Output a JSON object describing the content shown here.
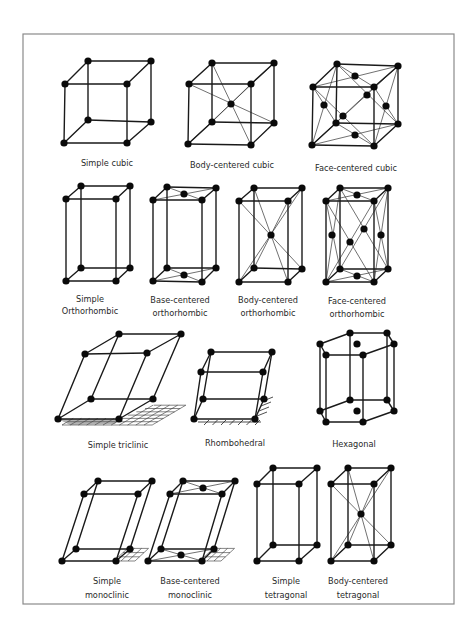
{
  "figure": {
    "frame": {
      "x": 23,
      "y": 34,
      "width": 431,
      "height": 570,
      "color": "#8a8a8a"
    },
    "atom_color": "#0a0a0a",
    "edge_color": "#1a1a1a"
  },
  "lattices": [
    {
      "id": "simple-cubic",
      "label_lines": [
        "Simple cubic"
      ],
      "label_x": 107,
      "label_y": [
        166
      ]
    },
    {
      "id": "body-centered-cubic",
      "label_lines": [
        "Body-centered cubic"
      ],
      "label_x": 232,
      "label_y": [
        168
      ]
    },
    {
      "id": "face-centered-cubic",
      "label_lines": [
        "Face-centered cubic"
      ],
      "label_x": 356,
      "label_y": [
        171
      ]
    },
    {
      "id": "simple-orthorhombic",
      "label_lines": [
        "Simple",
        "Orthorhombic"
      ],
      "label_x": 90,
      "label_y": [
        302,
        314
      ]
    },
    {
      "id": "base-centered-orthorhombic",
      "label_lines": [
        "Base-centered",
        "orthorhombic"
      ],
      "label_x": 180,
      "label_y": [
        303,
        316
      ]
    },
    {
      "id": "body-centered-orthorhombic",
      "label_lines": [
        "Body-centered",
        "orthorhombic"
      ],
      "label_x": 268,
      "label_y": [
        303,
        316
      ]
    },
    {
      "id": "face-centered-orthorhombic",
      "label_lines": [
        "Face-centered",
        "orthorhombic"
      ],
      "label_x": 357,
      "label_y": [
        304,
        317
      ]
    },
    {
      "id": "simple-triclinic",
      "label_lines": [
        "Simple triclinic"
      ],
      "label_x": 118,
      "label_y": [
        448
      ]
    },
    {
      "id": "rhombohedral",
      "label_lines": [
        "Rhombohedral"
      ],
      "label_x": 235,
      "label_y": [
        446
      ]
    },
    {
      "id": "hexagonal",
      "label_lines": [
        "Hexagonal"
      ],
      "label_x": 354,
      "label_y": [
        447
      ]
    },
    {
      "id": "simple-monoclinic",
      "label_lines": [
        "Simple",
        "monoclinic"
      ],
      "label_x": 107,
      "label_y": [
        584,
        598
      ]
    },
    {
      "id": "base-centered-monoclinic",
      "label_lines": [
        "Base-centered",
        "monoclinic"
      ],
      "label_x": 190,
      "label_y": [
        584,
        598
      ]
    },
    {
      "id": "simple-tetragonal",
      "label_lines": [
        "Simple",
        "tetragonal"
      ],
      "label_x": 286,
      "label_y": [
        584,
        598
      ]
    },
    {
      "id": "body-centered-tetragonal",
      "label_lines": [
        "Body-centered",
        "tetragonal"
      ],
      "label_x": 358,
      "label_y": [
        584,
        598
      ]
    }
  ],
  "geometry": {
    "simple-cubic": {
      "box": [
        [
          88,
          61
        ],
        [
          151,
          61
        ],
        [
          127,
          84
        ],
        [
          65,
          84
        ],
        [
          88,
          120
        ],
        [
          151,
          122
        ],
        [
          127,
          143
        ],
        [
          64,
          143
        ]
      ],
      "extra": [],
      "diagonals": []
    },
    "body-centered-cubic": {
      "box": [
        [
          212,
          63
        ],
        [
          274,
          63
        ],
        [
          251,
          84
        ],
        [
          189,
          84
        ],
        [
          212,
          122
        ],
        [
          274,
          123
        ],
        [
          251,
          145
        ],
        [
          188,
          144
        ]
      ],
      "extra": [
        [
          231,
          104
        ]
      ],
      "diagonals": [
        [
          0,
          6
        ],
        [
          1,
          7
        ],
        [
          2,
          4
        ],
        [
          3,
          5
        ]
      ]
    },
    "face-centered-cubic": {
      "box": [
        [
          337,
          64
        ],
        [
          398,
          66
        ],
        [
          374,
          87
        ],
        [
          313,
          87
        ],
        [
          336,
          123
        ],
        [
          398,
          124
        ],
        [
          374,
          146
        ],
        [
          312,
          145
        ]
      ],
      "extra": [
        [
          355,
          76
        ],
        [
          367,
          95
        ],
        [
          324,
          105
        ],
        [
          386,
          106
        ],
        [
          343,
          116
        ],
        [
          355,
          135
        ]
      ],
      "faces": [
        [
          0,
          1,
          2,
          3
        ],
        [
          0,
          1,
          5,
          4
        ],
        [
          0,
          3,
          7,
          4
        ],
        [
          1,
          2,
          6,
          5
        ],
        [
          3,
          2,
          6,
          7
        ],
        [
          4,
          5,
          6,
          7
        ]
      ]
    },
    "simple-orthorhombic": {
      "box": [
        [
          81,
          186
        ],
        [
          130,
          186
        ],
        [
          116,
          199
        ],
        [
          66,
          199
        ],
        [
          81,
          268
        ],
        [
          130,
          268
        ],
        [
          116,
          281
        ],
        [
          66,
          281
        ]
      ],
      "extra": []
    },
    "base-centered-orthorhombic": {
      "box": [
        [
          167,
          187
        ],
        [
          216,
          188
        ],
        [
          202,
          200
        ],
        [
          153,
          200
        ],
        [
          167,
          268
        ],
        [
          216,
          268
        ],
        [
          202,
          282
        ],
        [
          153,
          281
        ]
      ],
      "extra": [
        [
          184,
          194
        ],
        [
          184,
          275
        ]
      ],
      "faces": [
        [
          0,
          1,
          2,
          3
        ],
        [
          4,
          5,
          6,
          7
        ]
      ]
    },
    "body-centered-orthorhombic": {
      "box": [
        [
          254,
          188
        ],
        [
          302,
          188
        ],
        [
          288,
          201
        ],
        [
          239,
          201
        ],
        [
          254,
          268
        ],
        [
          302,
          269
        ],
        [
          288,
          282
        ],
        [
          239,
          282
        ]
      ],
      "extra": [
        [
          271,
          235
        ]
      ],
      "diagonals": [
        [
          0,
          6
        ],
        [
          1,
          7
        ],
        [
          2,
          4
        ],
        [
          3,
          5
        ]
      ]
    },
    "face-centered-orthorhombic": {
      "box": [
        [
          340,
          188
        ],
        [
          388,
          188
        ],
        [
          374,
          201
        ],
        [
          326,
          201
        ],
        [
          340,
          269
        ],
        [
          388,
          269
        ],
        [
          374,
          282
        ],
        [
          326,
          282
        ]
      ],
      "extra": [
        [
          357,
          195
        ],
        [
          364,
          229
        ],
        [
          332,
          235
        ],
        [
          381,
          235
        ],
        [
          350,
          242
        ],
        [
          357,
          276
        ]
      ],
      "faces": [
        [
          0,
          1,
          2,
          3
        ],
        [
          0,
          1,
          5,
          4
        ],
        [
          0,
          3,
          7,
          4
        ],
        [
          1,
          2,
          6,
          5
        ],
        [
          3,
          2,
          6,
          7
        ],
        [
          4,
          5,
          6,
          7
        ]
      ]
    },
    "simple-triclinic": {
      "box": [
        [
          119,
          334
        ],
        [
          181,
          334
        ],
        [
          147,
          353
        ],
        [
          85,
          354
        ],
        [
          91,
          399
        ],
        [
          153,
          399
        ],
        [
          119,
          419
        ],
        [
          58,
          419
        ]
      ],
      "extra": []
    },
    "rhombohedral": {
      "box": [
        [
          211,
          352
        ],
        [
          272,
          352
        ],
        [
          263,
          372
        ],
        [
          201,
          372
        ],
        [
          203,
          399
        ],
        [
          264,
          399
        ],
        [
          255,
          419
        ],
        [
          194,
          419
        ]
      ],
      "extra": []
    },
    "hexagonal": {
      "top": [
        [
          350,
          333
        ],
        [
          387,
          333
        ],
        [
          394,
          344
        ],
        [
          363,
          355
        ],
        [
          326,
          355
        ],
        [
          320,
          344
        ]
      ],
      "top_center": [
        357,
        344
      ],
      "bottom": [
        [
          350,
          400
        ],
        [
          387,
          400
        ],
        [
          394,
          411
        ],
        [
          363,
          422
        ],
        [
          326,
          422
        ],
        [
          320,
          411
        ]
      ],
      "bottom_center": [
        357,
        411
      ]
    },
    "simple-monoclinic": {
      "box": [
        [
          98,
          481
        ],
        [
          152,
          481
        ],
        [
          138,
          494
        ],
        [
          84,
          494
        ],
        [
          76,
          549
        ],
        [
          130,
          549
        ],
        [
          116,
          561
        ],
        [
          62,
          561
        ]
      ],
      "extra": []
    },
    "base-centered-monoclinic": {
      "box": [
        [
          183,
          481
        ],
        [
          235,
          481
        ],
        [
          222,
          494
        ],
        [
          170,
          494
        ],
        [
          161,
          549
        ],
        [
          214,
          549
        ],
        [
          202,
          561
        ],
        [
          148,
          561
        ]
      ],
      "extra": [
        [
          203,
          488
        ],
        [
          181,
          555
        ]
      ],
      "faces": [
        [
          0,
          1,
          2,
          3
        ],
        [
          4,
          5,
          6,
          7
        ]
      ]
    },
    "simple-tetragonal": {
      "box": [
        [
          273,
          468
        ],
        [
          317,
          468
        ],
        [
          299,
          484
        ],
        [
          257,
          484
        ],
        [
          273,
          545
        ],
        [
          317,
          545
        ],
        [
          299,
          561
        ],
        [
          257,
          561
        ]
      ],
      "extra": []
    },
    "body-centered-tetragonal": {
      "box": [
        [
          348,
          468
        ],
        [
          391,
          468
        ],
        [
          374,
          484
        ],
        [
          331,
          484
        ],
        [
          348,
          545
        ],
        [
          391,
          545
        ],
        [
          374,
          561
        ],
        [
          331,
          561
        ]
      ],
      "extra": [
        [
          361,
          514
        ]
      ],
      "diagonals": [
        [
          0,
          6
        ],
        [
          1,
          7
        ],
        [
          2,
          4
        ],
        [
          3,
          5
        ]
      ]
    }
  }
}
